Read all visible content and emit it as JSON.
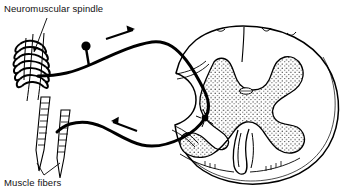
{
  "figure": {
    "width": 356,
    "height": 193,
    "background_color": "#ffffff",
    "line_color": "#000000",
    "stipple_color": "#1a1a1a"
  },
  "labels": {
    "spindle": "Neuromuscular spindle",
    "muscle_fibers": "Muscle fibers"
  },
  "annotations": {
    "afferent_arrow": "arrow-up-right",
    "efferent_arrow": "arrow-up-left",
    "spindle_leader": "leader-line-vertical",
    "muscle_leader": "leader-line-v-shape"
  },
  "structures": [
    {
      "name": "neuromuscular-spindle",
      "description": "coiled annulospiral sensory nerve ending wrapped around intrafusal muscle fibers"
    },
    {
      "name": "muscle-fibers",
      "description": "two striated extrafusal muscle fibers drawn as ladder-like tapering strips"
    },
    {
      "name": "afferent-sensory-fiber",
      "description": "sensory axon running from spindle to dorsal root of spinal cord"
    },
    {
      "name": "dorsal-root-ganglion-cell",
      "description": "unipolar cell body shown as filled dot on a short stalk off the afferent fiber"
    },
    {
      "name": "efferent-motor-fiber",
      "description": "motor axon running from ventral horn back to muscle fibers"
    },
    {
      "name": "spinal-cord-cross-section",
      "description": "oval transverse section of spinal cord"
    },
    {
      "name": "gray-matter",
      "description": "butterfly/H-shaped stippled gray matter with dorsal and ventral horns"
    },
    {
      "name": "central-canal",
      "description": "small oval canal at center of gray commissure"
    },
    {
      "name": "ventral-median-fissure",
      "description": "deep midline cleft on the ventral surface"
    },
    {
      "name": "dorsal-median-sulcus",
      "description": "shallow midline groove on the dorsal surface"
    },
    {
      "name": "motor-neuron-cell-body",
      "description": "multipolar motor neuron soma in the ventral horn"
    }
  ]
}
